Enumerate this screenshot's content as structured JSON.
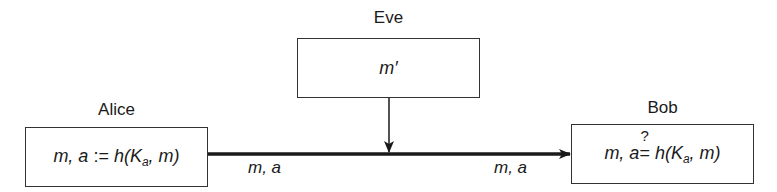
{
  "diagram": {
    "type": "message-authentication-attack",
    "parties": {
      "alice": {
        "name": "Alice",
        "expr_prefix": "m, a ",
        "op": ":=",
        "expr_func": " h(K",
        "expr_sub": "a",
        "expr_suffix": ", m)"
      },
      "eve": {
        "name": "Eve",
        "expr": "m′"
      },
      "bob": {
        "name": "Bob",
        "expr_prefix": "m, a",
        "op": "=",
        "op_mark": "?",
        "expr_func": " h(K",
        "expr_sub": "a",
        "expr_suffix": ", m)"
      }
    },
    "edges": [
      {
        "from": "Alice",
        "to": "Bob",
        "label_left": "m, a",
        "label_right": "m, a"
      },
      {
        "from": "Eve",
        "to": "channel",
        "label": ""
      }
    ],
    "colors": {
      "line": "#1a1a1a",
      "box_border": "#333333",
      "background": "#ffffff"
    }
  }
}
